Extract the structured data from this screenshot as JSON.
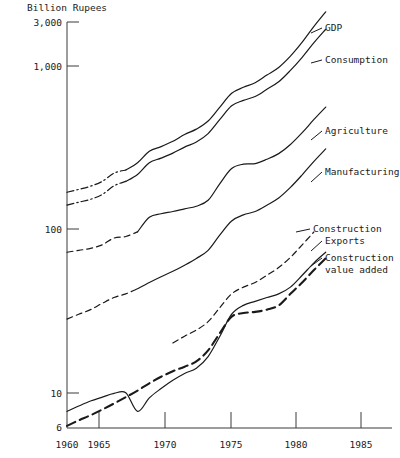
{
  "chart_data": {
    "type": "line",
    "title": "",
    "ylabel": "Billion Rupees",
    "xlabel": "",
    "yscale": "log",
    "ylim": [
      6,
      3000
    ],
    "xlim": [
      1960,
      1985
    ],
    "grid": false,
    "legend_position": "right-inline-labels",
    "ytick_labels": [
      "3,000",
      "1,000",
      "100",
      "10",
      "6"
    ],
    "ytick_values": [
      3000,
      1000,
      100,
      10,
      6
    ],
    "xtick_labels": [
      "1960",
      "1965",
      "1970",
      "1975",
      "1980",
      "1985"
    ],
    "xtick_values": [
      1960,
      1965,
      1970,
      1975,
      1980,
      1985
    ],
    "series": [
      {
        "name": "GDP",
        "style": "solid-with-dashdot-start",
        "x": [
          1960,
          1961,
          1962,
          1963,
          1964,
          1965,
          1966,
          1967,
          1968,
          1969,
          1970,
          1971,
          1972,
          1973,
          1974,
          1975,
          1976,
          1977,
          1978,
          1979,
          1980,
          1981,
          1982
        ],
        "values": [
          168,
          175,
          183,
          196,
          220,
          230,
          255,
          300,
          320,
          345,
          380,
          410,
          460,
          560,
          680,
          740,
          790,
          880,
          980,
          1150,
          1400,
          1750,
          2150
        ]
      },
      {
        "name": "Consumption",
        "style": "solid-with-dashdot-start",
        "x": [
          1960,
          1961,
          1962,
          1963,
          1964,
          1965,
          1966,
          1967,
          1968,
          1969,
          1970,
          1971,
          1972,
          1973,
          1974,
          1975,
          1976,
          1977,
          1978,
          1979,
          1980,
          1981,
          1982
        ],
        "values": [
          140,
          146,
          152,
          163,
          184,
          196,
          216,
          255,
          272,
          292,
          318,
          342,
          385,
          470,
          570,
          615,
          650,
          720,
          800,
          940,
          1130,
          1390,
          1680
        ]
      },
      {
        "name": "Agriculture",
        "style": "solid-with-dashed-start",
        "x": [
          1960,
          1961,
          1962,
          1963,
          1964,
          1965,
          1966,
          1967,
          1968,
          1969,
          1970,
          1971,
          1972,
          1973,
          1974,
          1975,
          1976,
          1977,
          1978,
          1979,
          1980,
          1981,
          1982
        ],
        "values": [
          72,
          74,
          76,
          80,
          88,
          90,
          96,
          118,
          124,
          128,
          133,
          138,
          150,
          190,
          235,
          250,
          252,
          268,
          290,
          330,
          390,
          470,
          560
        ]
      },
      {
        "name": "Manufacturing",
        "style": "solid-with-dashed-start",
        "x": [
          1960,
          1961,
          1962,
          1963,
          1964,
          1965,
          1966,
          1967,
          1968,
          1969,
          1970,
          1971,
          1972,
          1973,
          1974,
          1975,
          1976,
          1977,
          1978,
          1979,
          1980,
          1981,
          1982
        ],
        "values": [
          28,
          30,
          32,
          35,
          38,
          40,
          43,
          47,
          51,
          55,
          60,
          66,
          74,
          92,
          112,
          122,
          128,
          140,
          155,
          180,
          215,
          260,
          310
        ]
      },
      {
        "name": "Construction",
        "style": "dashed-segment",
        "x": [
          1969,
          1970,
          1971,
          1972,
          1973,
          1974,
          1975,
          1976,
          1977,
          1978,
          1979,
          1980,
          1981
        ],
        "values": [
          20,
          22,
          24,
          27,
          33,
          40,
          44,
          47,
          52,
          58,
          67,
          80,
          96
        ]
      },
      {
        "name": "Exports",
        "style": "solid",
        "x": [
          1960,
          1961,
          1962,
          1963,
          1964,
          1965,
          1966,
          1967,
          1968,
          1969,
          1970,
          1971,
          1972,
          1973,
          1974,
          1975,
          1976,
          1977,
          1978,
          1979,
          1980,
          1981,
          1982
        ],
        "values": [
          7.6,
          8.2,
          8.8,
          9.3,
          9.8,
          9.9,
          7.6,
          9.2,
          10.5,
          11.8,
          13.0,
          14.0,
          16.5,
          22.0,
          30.0,
          34.0,
          36.0,
          38.0,
          40.0,
          44.0,
          52.0,
          62.0,
          72.0
        ]
      },
      {
        "name": "Construction value added",
        "style": "heavy-dashed",
        "x": [
          1960,
          1961,
          1962,
          1963,
          1964,
          1965,
          1966,
          1967,
          1968,
          1969,
          1970,
          1971,
          1972,
          1973,
          1974,
          1975,
          1976,
          1977,
          1978,
          1979,
          1980,
          1981,
          1982
        ],
        "values": [
          6.2,
          6.7,
          7.2,
          7.8,
          8.5,
          9.3,
          10.2,
          11.3,
          12.4,
          13.4,
          14.3,
          15.4,
          18.0,
          23.0,
          29.0,
          30.5,
          31.0,
          32.0,
          34.0,
          40.0,
          47.0,
          56.0,
          66.0
        ]
      }
    ],
    "annotations": [
      {
        "label": "GDP",
        "x": 1982,
        "y": 2150
      },
      {
        "label": "Consumption",
        "x": 1982,
        "y": 1680
      },
      {
        "label": "Agriculture",
        "x": 1982,
        "y": 560
      },
      {
        "label": "Manufacturing",
        "x": 1982,
        "y": 310
      },
      {
        "label": "Construction",
        "x": 1981,
        "y": 96
      },
      {
        "label": "Exports",
        "x": 1982,
        "y": 72
      },
      {
        "label": "Construction value added",
        "x": 1982,
        "y": 66
      }
    ]
  },
  "labels": {
    "y_axis_title": "Billion Rupees",
    "y_3000": "3,000",
    "y_1000": "1,000",
    "y_100": "100",
    "y_10": "10",
    "y_6": "6",
    "x_1960": "1960",
    "x_1965": "1965",
    "x_1970": "1970",
    "x_1975": "1975",
    "x_1980": "1980",
    "x_1985": "1985",
    "s_gdp": "GDP",
    "s_consumption": "Consumption",
    "s_agriculture": "Agriculture",
    "s_manufacturing": "Manufacturing",
    "s_construction": "Construction",
    "s_exports": "Exports",
    "s_cva_line1": "Construction",
    "s_cva_line2": "value added"
  },
  "colors": {
    "ink": "#1a1a1a",
    "axis": "#3a3a3a",
    "background": "#ffffff"
  }
}
